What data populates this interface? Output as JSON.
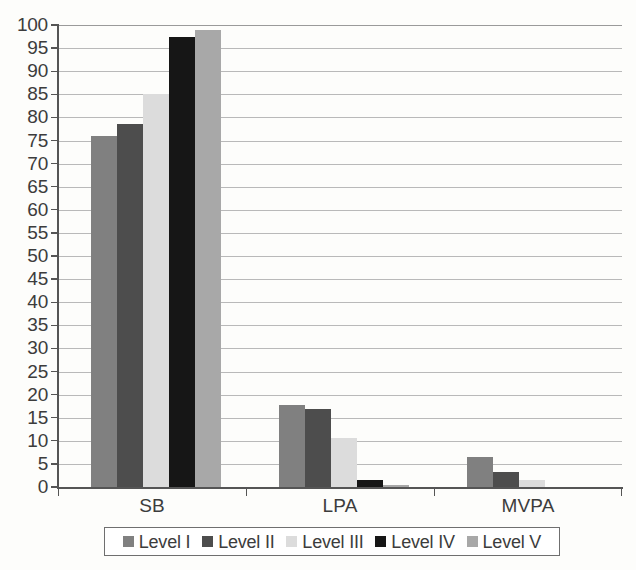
{
  "chart_data": {
    "type": "bar",
    "title": "",
    "xlabel": "",
    "ylabel": "",
    "categories": [
      "SB",
      "LPA",
      "MVPA"
    ],
    "series": [
      {
        "name": "Level I",
        "color": "#808080",
        "values": [
          76.0,
          17.8,
          6.5
        ]
      },
      {
        "name": "Level II",
        "color": "#4d4d4d",
        "values": [
          78.5,
          16.8,
          3.3
        ]
      },
      {
        "name": "Level III",
        "color": "#dcdcdc",
        "values": [
          85.0,
          10.5,
          1.5
        ]
      },
      {
        "name": "Level IV",
        "color": "#161616",
        "values": [
          97.5,
          1.5,
          0.0
        ]
      },
      {
        "name": "Level V",
        "color": "#a8a8a8",
        "values": [
          99.0,
          0.5,
          0.0
        ]
      }
    ],
    "ylim": [
      0,
      100
    ],
    "ytick_step": 5,
    "yticks": [
      0,
      5,
      10,
      15,
      20,
      25,
      30,
      35,
      40,
      45,
      50,
      55,
      60,
      65,
      70,
      75,
      80,
      85,
      90,
      95,
      100
    ],
    "grid": true,
    "grid_axis": "y",
    "legend_position": "bottom",
    "legend_entries": [
      "Level I",
      "Level II",
      "Level III",
      "Level IV",
      "Level V"
    ],
    "background_color": "#fdfdfb",
    "axis_color": "#555555",
    "gridline_color": "#b9b9b9"
  }
}
